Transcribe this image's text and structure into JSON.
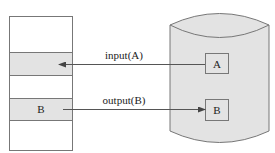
{
  "diagram": {
    "buffer": {
      "blocks": [
        {
          "label": "",
          "shaded": false
        },
        {
          "label": "",
          "shaded": true
        },
        {
          "label": "",
          "shaded": false
        },
        {
          "label": "B",
          "shaded": true
        },
        {
          "label": "",
          "shaded": false
        }
      ]
    },
    "disk": {
      "blocks": [
        {
          "label": "A"
        },
        {
          "label": "B"
        }
      ]
    },
    "arrows": [
      {
        "label": "input(A)",
        "direction": "disk-to-buffer"
      },
      {
        "label": "output(B)",
        "direction": "buffer-to-disk"
      }
    ],
    "colors": {
      "shade": "#e3e3e3",
      "stroke": "#666666",
      "text": "#222222"
    }
  }
}
